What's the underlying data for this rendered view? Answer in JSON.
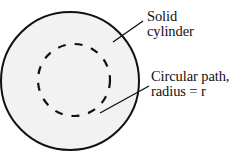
{
  "figure": {
    "background_color": "#ffffff",
    "stroke_color": "#111111",
    "fill_color": "#f2f2f2"
  },
  "shapes": {
    "outer_circle": {
      "name": "solid-cylinder-cross-section",
      "center_x": 70,
      "center_y": 81,
      "radius": 70,
      "stroke_width": 2,
      "fill": "#f2f2f2",
      "stroke": "#111111"
    },
    "inner_circle": {
      "name": "circular-path",
      "center_x": 74,
      "center_y": 80,
      "radius": 36,
      "stroke_width": 2.2,
      "fill": "none",
      "stroke": "#111111",
      "dash_pattern": "8 9"
    }
  },
  "leader_lines": [
    {
      "name": "leader-line-solid-cylinder",
      "x1": 113,
      "y1": 42,
      "x2": 143,
      "y2": 21
    },
    {
      "name": "leader-line-circular-path",
      "x1": 100,
      "y1": 113,
      "x2": 149,
      "y2": 86
    }
  ],
  "labels": {
    "solid_cylinder": {
      "line1": "Solid",
      "line2": "cylinder"
    },
    "circular_path": {
      "line1": "Circular path,",
      "line2": "radius = r"
    }
  }
}
